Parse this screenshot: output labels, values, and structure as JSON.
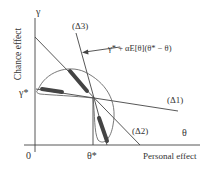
{
  "diagram": {
    "axes": {
      "y_symbol": "γ",
      "y_label": "Chance effect",
      "x_symbol": "θ",
      "x_label": "Personal effect",
      "origin": "0"
    },
    "markers": {
      "gamma_star": "γ*",
      "theta_star": "θ*"
    },
    "lines": {
      "delta1": "(Δ1)",
      "delta2": "(Δ2)",
      "delta3": "(Δ3)"
    },
    "annotation": "γ* + αE[θ](θ* − θ)",
    "colors": {
      "ink": "#444444",
      "text": "#333333",
      "background": "#ffffff"
    }
  }
}
